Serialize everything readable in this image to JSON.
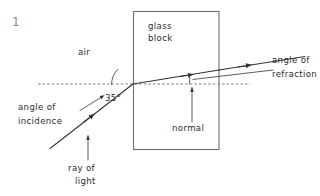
{
  "page": {
    "question_number": "1",
    "background_color": "#ffffff",
    "ink_color": "#333333"
  },
  "diagram": {
    "type": "ray-diagram-refraction",
    "medium_label": "air",
    "block_label_line1": "glass",
    "block_label_line2": "block",
    "angle_value": "35°",
    "label_angle_of_incidence_line1": "angle of",
    "label_angle_of_incidence_line2": "incidence",
    "label_angle_of_refraction_line1": "angle of",
    "label_angle_of_refraction_line2": "refraction",
    "label_normal": "normal",
    "label_ray_line1": "ray of",
    "label_ray_line2": "light"
  },
  "geometry": {
    "block": {
      "x": 133,
      "y": 11,
      "width": 86,
      "height": 139
    },
    "normal_dashed_line": {
      "x1": 38,
      "y1": 84,
      "x2": 250,
      "y2": 84
    },
    "incident_ray": {
      "x1": 50,
      "y1": 148,
      "x2": 133,
      "y2": 84
    },
    "refracted_ray": {
      "x1": 133,
      "y1": 84,
      "x2": 219,
      "y2": 70
    },
    "emergent_ray": {
      "x1": 219,
      "y1": 70,
      "x2": 300,
      "y2": 58
    },
    "incidence_arc_center": {
      "x": 133,
      "y": 84,
      "radius": 22
    },
    "refraction_arc_center": {
      "x": 190,
      "y": 84,
      "radius": 0
    }
  }
}
